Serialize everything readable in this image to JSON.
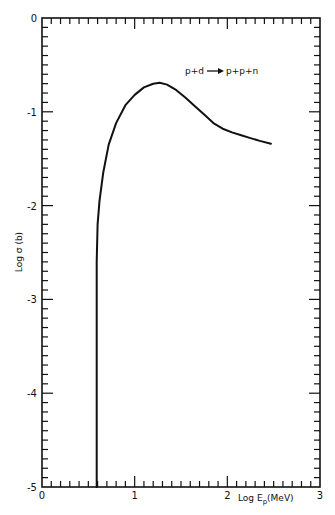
{
  "chart_data": {
    "type": "line",
    "title": "",
    "annotation": "p+d → p+p+n",
    "annotation_parts": {
      "left": "p+d",
      "right": "p+p+n"
    },
    "xlabel": "Log E",
    "xlabel_sub": "p",
    "xlabel_unit": "(MeV)",
    "ylabel": "Log σ (b)",
    "xlim": [
      0,
      3
    ],
    "ylim": [
      -5,
      0
    ],
    "x_ticks": [
      "0",
      "1",
      "2",
      "3"
    ],
    "y_ticks": [
      "0",
      "-1",
      "-2",
      "-3",
      "-4",
      "-5"
    ],
    "grid": false,
    "legend": null,
    "series": [
      {
        "name": "p+d -> p+p+n",
        "x": [
          0.59,
          0.59,
          0.59,
          0.6,
          0.62,
          0.66,
          0.72,
          0.8,
          0.9,
          1.0,
          1.1,
          1.2,
          1.27,
          1.35,
          1.45,
          1.55,
          1.65,
          1.75,
          1.85,
          1.95,
          2.05,
          2.15,
          2.25,
          2.35,
          2.47
        ],
        "y": [
          -5.0,
          -3.5,
          -2.6,
          -2.2,
          -1.95,
          -1.65,
          -1.35,
          -1.12,
          -0.93,
          -0.82,
          -0.74,
          -0.7,
          -0.69,
          -0.71,
          -0.77,
          -0.85,
          -0.94,
          -1.03,
          -1.12,
          -1.18,
          -1.22,
          -1.25,
          -1.28,
          -1.31,
          -1.34
        ]
      }
    ]
  }
}
